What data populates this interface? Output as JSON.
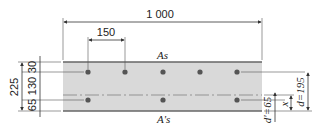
{
  "diagram": {
    "type": "reinforced-concrete-slab-cross-section",
    "dimensions": {
      "width": "1 000",
      "bar_spacing": "150",
      "total_height": "225",
      "top_cover": "30",
      "middle": "130",
      "bottom_cover": "65",
      "effective_depth": "d=195",
      "compression_cover": "d'=65",
      "neutral_axis_depth": "x"
    },
    "labels": {
      "tension_steel": "As",
      "compression_steel": "A's"
    },
    "rebar": {
      "top_row_count": 5,
      "bottom_row_count": 3
    },
    "colors": {
      "concrete_fill": "#d9d9d9",
      "edge_line": "#555555",
      "rebar": "#555555"
    }
  }
}
